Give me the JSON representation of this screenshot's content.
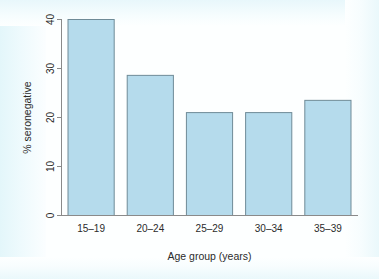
{
  "chart_data": {
    "type": "bar",
    "title": "",
    "subtitle": "",
    "categories": [
      "15–19",
      "20–24",
      "25–29",
      "30–34",
      "35–39"
    ],
    "values": [
      40.0,
      28.6,
      21.0,
      21.0,
      23.5
    ],
    "xlabel": "Age group (years)",
    "ylabel": "% seronegative",
    "ylim": [
      0,
      41
    ],
    "xlim": [
      0,
      5
    ],
    "yticks": [
      0,
      10,
      20,
      30,
      40
    ],
    "ytick_labels": [
      "0",
      "10",
      "20",
      "30",
      "40"
    ],
    "grid": false,
    "legend": false,
    "legend_position": "none",
    "bar_fill_color": "#b5dbec",
    "bar_border_color": "#6f8b97",
    "axis_color": "#8a8a8a",
    "background_color": "#fdffff",
    "ytick_label_rotation": 90,
    "ylabel_rotation": 90,
    "annotations": []
  },
  "figure": {
    "name": "seronegative-by-age-group-bar-chart",
    "background_color": "#fdffff"
  }
}
